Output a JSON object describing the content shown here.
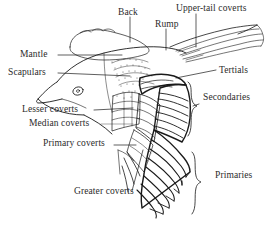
{
  "figure": {
    "type": "line-art-diagram",
    "background_color": "#ffffff",
    "ink_color": "#1a1a1a",
    "text_color": "#2b2b2b"
  },
  "labels": [
    {
      "id": "back",
      "text": "Back",
      "x": 118,
      "y": 8,
      "anchor": "start"
    },
    {
      "id": "rump",
      "text": "Rump",
      "x": 155,
      "y": 20,
      "anchor": "start"
    },
    {
      "id": "upper_tail",
      "text": "Upper-tail coverts",
      "x": 182,
      "y": 5,
      "anchor": "start"
    },
    {
      "id": "mantle",
      "text": "Mantle",
      "x": 20,
      "y": 58,
      "anchor": "start"
    },
    {
      "id": "scapulars",
      "text": "Scapulars",
      "x": 8,
      "y": 76,
      "anchor": "start"
    },
    {
      "id": "tertials",
      "text": "Tertials",
      "x": 219,
      "y": 73,
      "anchor": "start"
    },
    {
      "id": "secondaries",
      "text": "Secondaries",
      "x": 203,
      "y": 100,
      "anchor": "start"
    },
    {
      "id": "lesser_coverts",
      "text": "Lesser coverts",
      "x": 22,
      "y": 113,
      "anchor": "start"
    },
    {
      "id": "median_coverts",
      "text": "Median coverts",
      "x": 29,
      "y": 127,
      "anchor": "start"
    },
    {
      "id": "primary_coverts",
      "text": "Primary coverts",
      "x": 43,
      "y": 147,
      "anchor": "start"
    },
    {
      "id": "primaries",
      "text": "Primaries",
      "x": 215,
      "y": 178,
      "anchor": "start"
    },
    {
      "id": "greater_coverts",
      "text": "Greater coverts",
      "x": 74,
      "y": 194,
      "anchor": "start"
    }
  ],
  "braces": [
    {
      "id": "secondaries-brace",
      "region": "Secondaries",
      "x": 192,
      "y_top": 82,
      "y_bottom": 136
    },
    {
      "id": "primaries-brace",
      "region": "Primaries",
      "x": 196,
      "y_top": 152,
      "y_bottom": 214
    }
  ],
  "anatomy_parts": [
    "Back",
    "Rump",
    "Upper-tail coverts",
    "Mantle",
    "Scapulars",
    "Tertials",
    "Secondaries",
    "Lesser coverts",
    "Median coverts",
    "Primary coverts",
    "Primaries",
    "Greater coverts"
  ]
}
